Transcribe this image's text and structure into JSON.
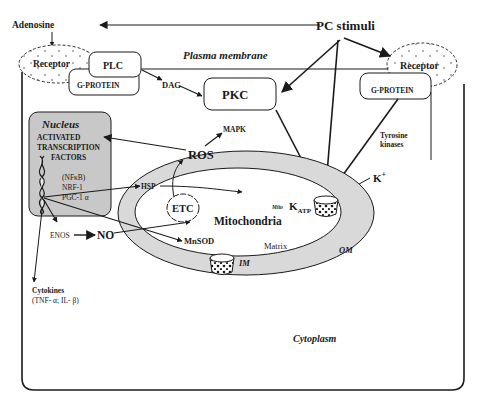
{
  "labels": {
    "adenosine": "Adenosine",
    "pc_stimuli": "PC stimuli",
    "plasma_membrane": "Plasma membrane",
    "receptor_left": "Receptor",
    "plc": "PLC",
    "g_protein_left": "G-PROTEIN",
    "dag": "DAG",
    "pkc": "PKC",
    "receptor_right": "Receptor",
    "g_protein_right": "G-PROTEIN",
    "tyrosine": "Tyrosine",
    "kinases": "kinases",
    "k_plus": "K",
    "k_plus_sup": "+",
    "mapk": "MAPK",
    "ros": "ROS",
    "nucleus": "Nucleus",
    "activated": "ACTIVATED",
    "transcription": "TRANSCRIPTION",
    "factors": "FACTORS",
    "nfkb": "(NFκB)",
    "nrf1": "NRF-1",
    "pgc1a": "PGC-1 α",
    "hsp": "HSP",
    "etc": "ETC",
    "mito_small": "Mito",
    "katp": "K",
    "katp_sub": "ATP",
    "mitochondria": "Mitochondria",
    "enos": "ENOS",
    "no": "NO",
    "mnsod": "MnSOD",
    "matrix": "Matrix",
    "im": "IM",
    "om": "OM",
    "cytokines": "Cytokines",
    "cytokines_list": "(TNF- α; IL- β)",
    "cytoplasm": "Cytoplasm"
  },
  "colors": {
    "line": "#1a1a1a",
    "nucleus_fill": "#c8c8c8",
    "om_fill": "#d9d9d9",
    "background": "#ffffff"
  }
}
